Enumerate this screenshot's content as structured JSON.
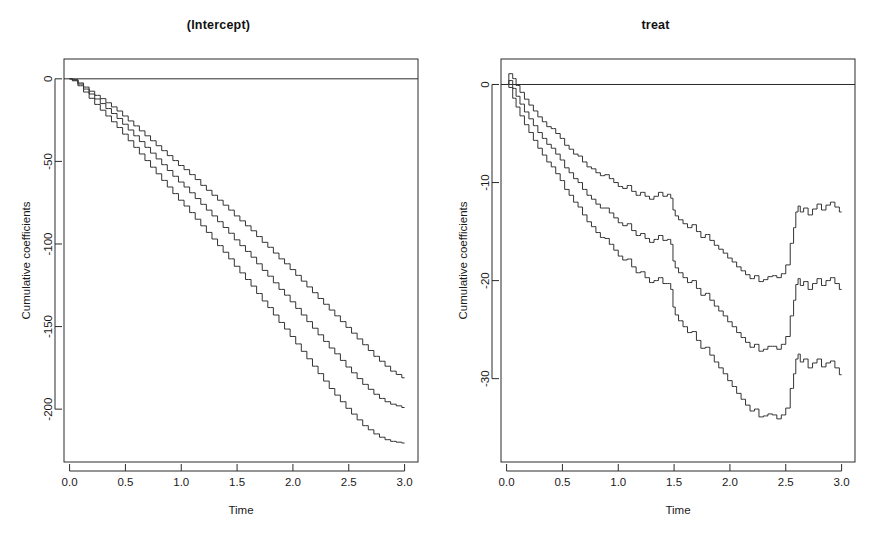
{
  "figure": {
    "background": "#ffffff",
    "line_color": "#333333",
    "axis_color": "#2b2b2b"
  },
  "chart_data": [
    {
      "type": "line",
      "panel": "left",
      "title": "(Intercept)",
      "xlabel": "Time",
      "ylabel": "Cumulative coefficients",
      "xlim": [
        -0.05,
        3.12
      ],
      "ylim": [
        -232,
        12
      ],
      "xticks": [
        0.0,
        0.5,
        1.0,
        1.5,
        2.0,
        2.5,
        3.0
      ],
      "xticklabels": [
        "0.0",
        "0.5",
        "1.0",
        "1.5",
        "2.0",
        "2.5",
        "3.0"
      ],
      "yticks": [
        0,
        -50,
        -100,
        -150,
        -200
      ],
      "yticklabels": [
        "0",
        "-50",
        "-100",
        "-150",
        "-200"
      ],
      "grid": false,
      "legend": null,
      "reference_line": {
        "y": 0,
        "style": "solid"
      },
      "series": [
        {
          "name": "upper-confidence-band",
          "x": [
            0.0,
            0.05,
            0.1,
            0.15,
            0.2,
            0.25,
            0.3,
            0.35,
            0.4,
            0.45,
            0.5,
            0.55,
            0.6,
            0.65,
            0.7,
            0.75,
            0.8,
            0.85,
            0.9,
            0.95,
            1.0,
            1.05,
            1.1,
            1.15,
            1.2,
            1.25,
            1.3,
            1.35,
            1.4,
            1.45,
            1.5,
            1.55,
            1.6,
            1.65,
            1.7,
            1.75,
            1.8,
            1.85,
            1.9,
            1.95,
            2.0,
            2.05,
            2.1,
            2.15,
            2.2,
            2.25,
            2.3,
            2.35,
            2.4,
            2.45,
            2.5,
            2.55,
            2.6,
            2.65,
            2.7,
            2.75,
            2.8,
            2.85,
            2.9,
            2.95,
            3.0
          ],
          "y": [
            0.0,
            -0.5,
            -2.5,
            -5.0,
            -7.5,
            -10.0,
            -12.0,
            -14.5,
            -17.0,
            -19.5,
            -22.5,
            -25.5,
            -28.5,
            -31.5,
            -34.5,
            -37.5,
            -40.5,
            -43.5,
            -46.5,
            -49.5,
            -52.5,
            -55.0,
            -58.0,
            -61.0,
            -64.5,
            -67.5,
            -70.5,
            -73.5,
            -76.5,
            -79.5,
            -83.0,
            -86.0,
            -89.0,
            -92.0,
            -95.5,
            -99.0,
            -102.0,
            -105.5,
            -109.0,
            -112.0,
            -115.5,
            -119.0,
            -122.5,
            -126.0,
            -129.5,
            -133.0,
            -136.5,
            -140.0,
            -143.5,
            -147.0,
            -150.5,
            -154.0,
            -157.5,
            -161.0,
            -164.5,
            -168.0,
            -171.0,
            -174.0,
            -177.0,
            -179.0,
            -181.0
          ]
        },
        {
          "name": "estimate",
          "x": [
            0.0,
            0.05,
            0.1,
            0.15,
            0.2,
            0.25,
            0.3,
            0.35,
            0.4,
            0.45,
            0.5,
            0.55,
            0.6,
            0.65,
            0.7,
            0.75,
            0.8,
            0.85,
            0.9,
            0.95,
            1.0,
            1.05,
            1.1,
            1.15,
            1.2,
            1.25,
            1.3,
            1.35,
            1.4,
            1.45,
            1.5,
            1.55,
            1.6,
            1.65,
            1.7,
            1.75,
            1.8,
            1.85,
            1.9,
            1.95,
            2.0,
            2.05,
            2.1,
            2.15,
            2.2,
            2.25,
            2.3,
            2.35,
            2.4,
            2.45,
            2.5,
            2.55,
            2.6,
            2.65,
            2.7,
            2.75,
            2.8,
            2.85,
            2.9,
            2.95,
            3.0
          ],
          "y": [
            0.0,
            -0.8,
            -3.2,
            -6.2,
            -9.2,
            -12.2,
            -15.0,
            -18.0,
            -21.0,
            -24.0,
            -27.5,
            -31.0,
            -34.5,
            -38.0,
            -41.5,
            -45.0,
            -48.5,
            -52.0,
            -55.5,
            -59.0,
            -62.5,
            -65.5,
            -69.0,
            -72.5,
            -76.0,
            -79.5,
            -83.0,
            -86.5,
            -90.0,
            -93.5,
            -97.5,
            -101.0,
            -104.5,
            -108.0,
            -112.0,
            -116.0,
            -119.5,
            -123.5,
            -127.5,
            -131.0,
            -135.0,
            -139.0,
            -143.0,
            -147.0,
            -151.0,
            -155.0,
            -159.0,
            -163.0,
            -166.5,
            -170.5,
            -174.5,
            -178.0,
            -181.5,
            -185.0,
            -188.0,
            -191.0,
            -193.5,
            -195.5,
            -197.0,
            -198.0,
            -199.0
          ]
        },
        {
          "name": "lower-confidence-band",
          "x": [
            0.0,
            0.05,
            0.1,
            0.15,
            0.2,
            0.25,
            0.3,
            0.35,
            0.4,
            0.45,
            0.5,
            0.55,
            0.6,
            0.65,
            0.7,
            0.75,
            0.8,
            0.85,
            0.9,
            0.95,
            1.0,
            1.05,
            1.1,
            1.15,
            1.2,
            1.25,
            1.3,
            1.35,
            1.4,
            1.45,
            1.5,
            1.55,
            1.6,
            1.65,
            1.7,
            1.75,
            1.8,
            1.85,
            1.9,
            1.95,
            2.0,
            2.05,
            2.1,
            2.15,
            2.2,
            2.25,
            2.3,
            2.35,
            2.4,
            2.45,
            2.5,
            2.55,
            2.6,
            2.65,
            2.7,
            2.75,
            2.8,
            2.85,
            2.9,
            2.95,
            3.0
          ],
          "y": [
            0.0,
            -1.2,
            -4.2,
            -8.0,
            -11.8,
            -15.5,
            -19.0,
            -22.5,
            -26.0,
            -29.5,
            -33.5,
            -37.5,
            -41.5,
            -45.5,
            -49.5,
            -53.5,
            -57.5,
            -61.5,
            -65.5,
            -69.5,
            -73.5,
            -77.0,
            -81.0,
            -85.0,
            -89.0,
            -93.0,
            -97.0,
            -101.0,
            -105.0,
            -109.0,
            -113.5,
            -117.5,
            -121.5,
            -125.5,
            -130.0,
            -134.5,
            -138.5,
            -143.0,
            -147.5,
            -151.5,
            -156.0,
            -160.5,
            -165.0,
            -169.5,
            -174.0,
            -178.5,
            -183.0,
            -187.5,
            -191.5,
            -195.5,
            -199.5,
            -203.0,
            -206.5,
            -210.0,
            -212.5,
            -215.0,
            -217.0,
            -218.5,
            -219.5,
            -220.0,
            -220.5
          ]
        }
      ]
    },
    {
      "type": "line",
      "panel": "right",
      "title": "treat",
      "xlabel": "Time",
      "ylabel": "Cumulative coefficients",
      "xlim": [
        -0.05,
        3.12
      ],
      "ylim": [
        -38.5,
        2.6
      ],
      "xticks": [
        0.0,
        0.5,
        1.0,
        1.5,
        2.0,
        2.5,
        3.0
      ],
      "xticklabels": [
        "0.0",
        "0.5",
        "1.0",
        "1.5",
        "2.0",
        "2.5",
        "3.0"
      ],
      "yticks": [
        0,
        -10,
        -20,
        -30
      ],
      "yticklabels": [
        "0",
        "-10",
        "-20",
        "-30"
      ],
      "grid": false,
      "legend": null,
      "reference_line": {
        "y": 0,
        "style": "solid"
      },
      "series": [
        {
          "name": "upper-confidence-band",
          "x": [
            0.0,
            0.04,
            0.07,
            0.1,
            0.14,
            0.18,
            0.22,
            0.26,
            0.3,
            0.34,
            0.38,
            0.42,
            0.46,
            0.5,
            0.54,
            0.58,
            0.62,
            0.66,
            0.7,
            0.74,
            0.78,
            0.82,
            0.86,
            0.9,
            0.94,
            0.98,
            1.02,
            1.06,
            1.1,
            1.14,
            1.18,
            1.22,
            1.26,
            1.3,
            1.34,
            1.38,
            1.42,
            1.46,
            1.48,
            1.5,
            1.52,
            1.56,
            1.6,
            1.64,
            1.68,
            1.72,
            1.76,
            1.8,
            1.84,
            1.88,
            1.92,
            1.96,
            2.0,
            2.04,
            2.08,
            2.12,
            2.16,
            2.2,
            2.24,
            2.28,
            2.32,
            2.36,
            2.4,
            2.44,
            2.48,
            2.52,
            2.56,
            2.58,
            2.6,
            2.62,
            2.64,
            2.68,
            2.72,
            2.76,
            2.8,
            2.84,
            2.88,
            2.92,
            2.96,
            3.0
          ],
          "y": [
            0.0,
            1.1,
            0.6,
            -0.1,
            -0.8,
            -1.5,
            -2.1,
            -2.7,
            -3.3,
            -3.8,
            -4.3,
            -4.5,
            -5.0,
            -5.5,
            -6.2,
            -6.6,
            -7.1,
            -7.3,
            -7.9,
            -8.4,
            -8.6,
            -9.0,
            -9.3,
            -9.2,
            -9.6,
            -10.0,
            -10.4,
            -10.6,
            -10.3,
            -10.9,
            -11.3,
            -11.0,
            -11.4,
            -11.7,
            -11.4,
            -11.0,
            -11.4,
            -11.2,
            -11.6,
            -12.8,
            -13.4,
            -13.8,
            -14.2,
            -14.6,
            -14.3,
            -15.0,
            -15.6,
            -15.3,
            -15.9,
            -16.4,
            -16.8,
            -17.2,
            -17.7,
            -18.1,
            -18.6,
            -19.0,
            -19.4,
            -19.8,
            -19.5,
            -20.1,
            -19.9,
            -19.6,
            -19.5,
            -19.7,
            -19.3,
            -18.4,
            -16.2,
            -14.6,
            -13.0,
            -12.4,
            -13.0,
            -12.6,
            -13.3,
            -12.7,
            -12.2,
            -12.8,
            -12.3,
            -12.0,
            -12.5,
            -13.0
          ]
        },
        {
          "name": "estimate",
          "x": [
            0.0,
            0.04,
            0.07,
            0.1,
            0.14,
            0.18,
            0.22,
            0.26,
            0.3,
            0.34,
            0.38,
            0.42,
            0.46,
            0.5,
            0.54,
            0.58,
            0.62,
            0.66,
            0.7,
            0.74,
            0.78,
            0.82,
            0.86,
            0.9,
            0.94,
            0.98,
            1.02,
            1.06,
            1.1,
            1.14,
            1.18,
            1.22,
            1.26,
            1.3,
            1.34,
            1.38,
            1.42,
            1.46,
            1.48,
            1.5,
            1.52,
            1.56,
            1.6,
            1.64,
            1.68,
            1.72,
            1.76,
            1.8,
            1.84,
            1.88,
            1.92,
            1.96,
            2.0,
            2.04,
            2.08,
            2.12,
            2.16,
            2.2,
            2.24,
            2.28,
            2.32,
            2.36,
            2.4,
            2.44,
            2.48,
            2.52,
            2.56,
            2.58,
            2.6,
            2.62,
            2.64,
            2.68,
            2.72,
            2.76,
            2.8,
            2.84,
            2.88,
            2.92,
            2.96,
            3.0
          ],
          "y": [
            0.0,
            0.4,
            -0.4,
            -1.2,
            -2.0,
            -2.8,
            -3.5,
            -4.2,
            -4.9,
            -5.5,
            -6.1,
            -6.5,
            -7.1,
            -7.7,
            -8.5,
            -9.0,
            -9.6,
            -10.0,
            -10.7,
            -11.3,
            -11.7,
            -12.2,
            -12.6,
            -12.6,
            -13.1,
            -13.6,
            -14.1,
            -14.4,
            -14.2,
            -14.9,
            -15.4,
            -15.2,
            -15.7,
            -16.1,
            -15.8,
            -15.4,
            -15.9,
            -15.8,
            -16.3,
            -18.0,
            -18.7,
            -19.2,
            -19.7,
            -20.2,
            -20.0,
            -20.8,
            -21.5,
            -21.3,
            -22.0,
            -22.6,
            -23.1,
            -23.6,
            -24.2,
            -24.7,
            -25.3,
            -25.8,
            -26.3,
            -26.8,
            -26.5,
            -27.2,
            -27.0,
            -26.7,
            -26.7,
            -27.0,
            -26.5,
            -25.7,
            -23.6,
            -22.0,
            -20.4,
            -19.8,
            -20.5,
            -20.1,
            -20.9,
            -20.3,
            -19.8,
            -20.5,
            -20.0,
            -19.7,
            -20.3,
            -20.9
          ]
        },
        {
          "name": "lower-confidence-band",
          "x": [
            0.0,
            0.04,
            0.07,
            0.1,
            0.14,
            0.18,
            0.22,
            0.26,
            0.3,
            0.34,
            0.38,
            0.42,
            0.46,
            0.5,
            0.54,
            0.58,
            0.62,
            0.66,
            0.7,
            0.74,
            0.78,
            0.82,
            0.86,
            0.9,
            0.94,
            0.98,
            1.02,
            1.06,
            1.1,
            1.14,
            1.18,
            1.22,
            1.26,
            1.3,
            1.34,
            1.38,
            1.42,
            1.46,
            1.48,
            1.5,
            1.52,
            1.56,
            1.6,
            1.64,
            1.68,
            1.72,
            1.76,
            1.8,
            1.84,
            1.88,
            1.92,
            1.96,
            2.0,
            2.04,
            2.08,
            2.12,
            2.16,
            2.2,
            2.24,
            2.28,
            2.32,
            2.36,
            2.4,
            2.44,
            2.48,
            2.52,
            2.56,
            2.58,
            2.6,
            2.62,
            2.64,
            2.68,
            2.72,
            2.76,
            2.8,
            2.84,
            2.88,
            2.92,
            2.96,
            3.0
          ],
          "y": [
            0.0,
            -0.3,
            -1.4,
            -2.3,
            -3.2,
            -4.1,
            -4.9,
            -5.7,
            -6.5,
            -7.2,
            -7.9,
            -8.4,
            -9.1,
            -9.8,
            -10.7,
            -11.3,
            -12.0,
            -12.5,
            -13.3,
            -14.0,
            -14.5,
            -15.1,
            -15.6,
            -15.7,
            -16.3,
            -16.9,
            -17.5,
            -17.9,
            -17.8,
            -18.6,
            -19.2,
            -19.1,
            -19.7,
            -20.2,
            -20.0,
            -19.7,
            -20.3,
            -20.3,
            -20.9,
            -22.7,
            -23.5,
            -24.1,
            -24.7,
            -25.3,
            -25.2,
            -26.1,
            -26.9,
            -26.8,
            -27.6,
            -28.3,
            -28.9,
            -29.5,
            -30.2,
            -30.8,
            -31.5,
            -32.1,
            -32.7,
            -33.3,
            -33.1,
            -33.9,
            -33.8,
            -33.6,
            -33.7,
            -34.1,
            -33.7,
            -33.0,
            -31.0,
            -29.5,
            -28.0,
            -27.5,
            -28.3,
            -28.0,
            -28.9,
            -28.4,
            -28.0,
            -28.8,
            -28.4,
            -28.2,
            -28.9,
            -29.6
          ]
        }
      ]
    }
  ]
}
